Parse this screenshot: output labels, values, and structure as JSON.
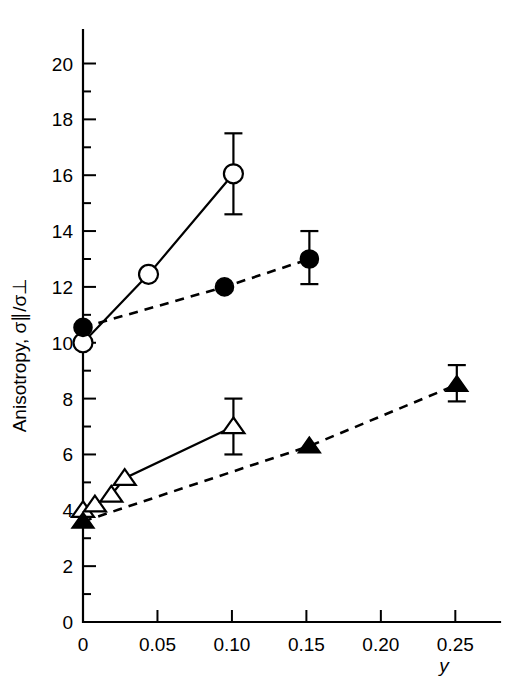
{
  "chart_data": {
    "type": "line",
    "title": "",
    "xlabel": "y",
    "ylabel": "Anisotropy, σ∥/σ⊥",
    "xlim": [
      0,
      0.28
    ],
    "ylim": [
      0,
      21.2
    ],
    "grid": false,
    "legend": "none",
    "x_ticks": [
      0,
      0.05,
      0.1,
      0.15,
      0.2,
      0.25
    ],
    "x_tick_labels": [
      "0",
      "0.05",
      "0.10",
      "0.15",
      "0.20",
      "0.25"
    ],
    "y_ticks": [
      0,
      2,
      4,
      6,
      8,
      10,
      12,
      14,
      16,
      18,
      20
    ],
    "y_tick_labels": [
      "0",
      "2",
      "4",
      "6",
      "8",
      "10",
      "12",
      "14",
      "16",
      "18",
      "20"
    ],
    "y_minor_ticks": [
      1,
      3,
      5,
      7,
      9,
      11,
      13,
      15,
      17,
      19
    ],
    "series": [
      {
        "name": "open-circles-upper",
        "marker": "open-circle",
        "line": "solid",
        "x": [
          0,
          0.044,
          0.101
        ],
        "y": [
          10.0,
          12.45,
          16.05
        ],
        "yerr_low": [
          null,
          null,
          14.6
        ],
        "yerr_high": [
          null,
          null,
          17.5
        ]
      },
      {
        "name": "filled-circles-upper",
        "marker": "filled-circle",
        "line": "dashed",
        "x": [
          0,
          0.095,
          0.152
        ],
        "y": [
          10.55,
          12.0,
          13.0
        ],
        "yerr_low": [
          null,
          null,
          12.1
        ],
        "yerr_high": [
          null,
          null,
          14.0
        ]
      },
      {
        "name": "open-triangles-lower",
        "marker": "open-triangle",
        "line": "solid",
        "x": [
          0,
          0.008,
          0.019,
          0.028,
          0.101
        ],
        "y": [
          4.0,
          4.2,
          4.55,
          5.15,
          7.0
        ],
        "yerr_low": [
          null,
          null,
          null,
          null,
          6.0
        ],
        "yerr_high": [
          null,
          null,
          null,
          null,
          8.0
        ]
      },
      {
        "name": "filled-triangles-lower",
        "marker": "filled-triangle",
        "line": "dashed",
        "x": [
          0,
          0.152,
          0.251
        ],
        "y": [
          3.6,
          6.3,
          8.5
        ],
        "yerr_low": [
          null,
          null,
          7.9
        ],
        "yerr_high": [
          null,
          null,
          9.2
        ]
      }
    ]
  },
  "axes": {
    "x_axis_title": "y",
    "y_axis_title": "Anisotropy, σ∥/σ⊥"
  },
  "colors": {
    "foreground": "#000000",
    "background": "#ffffff"
  }
}
